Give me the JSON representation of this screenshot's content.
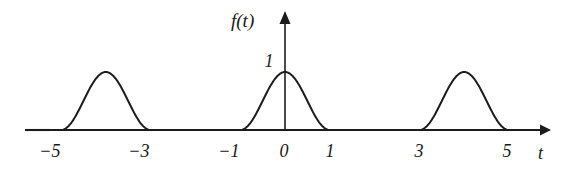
{
  "figure": {
    "caption": "",
    "background_color": "#ffffff",
    "stroke_color": "#1c1c1c"
  },
  "axes": {
    "y_axis_label": "f(t)",
    "x_axis_label": "t",
    "y_value_label": "1",
    "x_tick_labels": [
      "−5",
      "−3",
      "−1",
      "0",
      "1",
      "3",
      "5"
    ]
  },
  "chart_data": {
    "type": "line",
    "title": "",
    "xlabel": "t",
    "ylabel": "f(t)",
    "xlim": [
      -5.8,
      5.85
    ],
    "ylim": [
      0,
      1.28
    ],
    "grid": false,
    "legend": null,
    "annotations": [
      {
        "text": "1",
        "x": 0,
        "y": 1,
        "note": "peak amplitude marker on the f(t) axis"
      },
      {
        "text": "f(t)",
        "x": 0,
        "y": 1.28,
        "note": "vertical axis name"
      },
      {
        "text": "t",
        "x": 5.85,
        "y": 0,
        "note": "horizontal axis name"
      }
    ],
    "x_ticks": [
      -5,
      -3,
      -1,
      0,
      1,
      3,
      5
    ],
    "x_tick_labels": [
      "−5",
      "−3",
      "−1",
      "0",
      "1",
      "3",
      "5"
    ],
    "y_ticks": [
      1
    ],
    "y_tick_labels": [
      "1"
    ],
    "pulses": [
      {
        "start": -5,
        "end": -3,
        "center": -4,
        "amplitude": 1
      },
      {
        "start": -1,
        "end": 1,
        "center": 0,
        "amplitude": 1
      },
      {
        "start": 3,
        "end": 5,
        "center": 4,
        "amplitude": 1
      }
    ],
    "series": [
      {
        "name": "f(t)",
        "x": [
          -5.8,
          -5.0,
          -4.9,
          -4.8,
          -4.7,
          -4.6,
          -4.5,
          -4.4,
          -4.3,
          -4.2,
          -4.1,
          -4.0,
          -3.9,
          -3.8,
          -3.7,
          -3.6,
          -3.5,
          -3.4,
          -3.3,
          -3.2,
          -3.1,
          -3.0,
          -1.0,
          -0.9,
          -0.8,
          -0.7,
          -0.6,
          -0.5,
          -0.4,
          -0.3,
          -0.2,
          -0.1,
          0.0,
          0.1,
          0.2,
          0.3,
          0.4,
          0.5,
          0.6,
          0.7,
          0.8,
          0.9,
          1.0,
          3.0,
          3.1,
          3.2,
          3.3,
          3.4,
          3.5,
          3.6,
          3.7,
          3.8,
          3.9,
          4.0,
          4.1,
          4.2,
          4.3,
          4.4,
          4.5,
          4.6,
          4.7,
          4.8,
          4.9,
          5.0,
          5.8
        ],
        "y": [
          0,
          0,
          0.024,
          0.095,
          0.206,
          0.345,
          0.5,
          0.655,
          0.794,
          0.905,
          0.976,
          1.0,
          0.976,
          0.905,
          0.794,
          0.655,
          0.5,
          0.345,
          0.206,
          0.095,
          0.024,
          0,
          0,
          0.024,
          0.095,
          0.206,
          0.345,
          0.5,
          0.655,
          0.794,
          0.905,
          0.976,
          1.0,
          0.976,
          0.905,
          0.794,
          0.655,
          0.5,
          0.345,
          0.206,
          0.095,
          0.024,
          0,
          0,
          0.024,
          0.095,
          0.206,
          0.345,
          0.5,
          0.655,
          0.794,
          0.905,
          0.976,
          1.0,
          0.976,
          0.905,
          0.794,
          0.655,
          0.5,
          0.345,
          0.206,
          0.095,
          0.024,
          0,
          0
        ],
        "formula": "f(t) = sin^2(pi*(t - start)/2) on each pulse interval, 0 otherwise"
      }
    ]
  }
}
